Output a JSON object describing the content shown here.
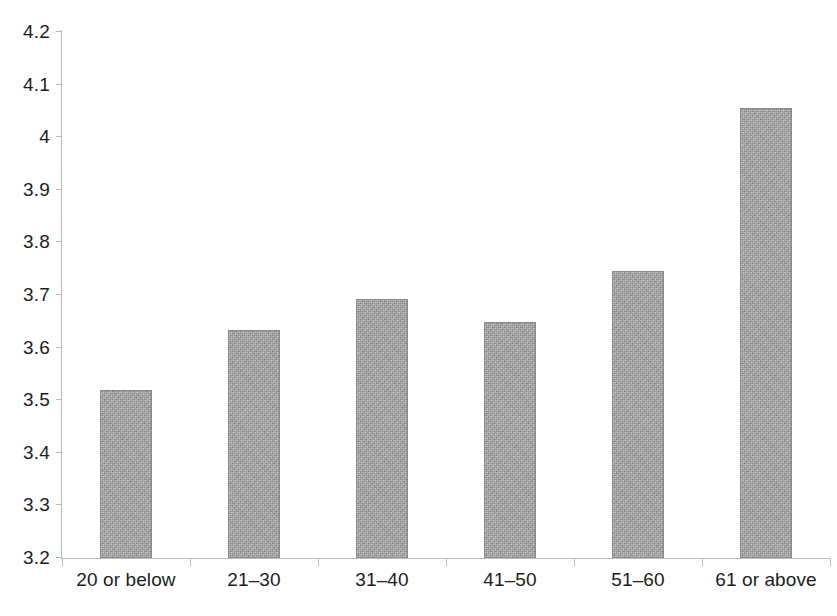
{
  "chart_data": {
    "type": "bar",
    "title": "",
    "subtitle": "",
    "xlabel": "",
    "ylabel": "",
    "categories": [
      "20 or below",
      "21–30",
      "31–40",
      "41–50",
      "51–60",
      "61 or above"
    ],
    "values": [
      3.52,
      3.633,
      3.692,
      3.649,
      3.745,
      4.056
    ],
    "series": [
      {
        "name": "",
        "values": [
          3.52,
          3.633,
          3.692,
          3.649,
          3.745,
          4.056
        ]
      }
    ],
    "ylim": [
      3.2,
      4.2
    ],
    "ytick_labels": [
      "3.2",
      "3.3",
      "3.4",
      "3.5",
      "3.6",
      "3.7",
      "3.8",
      "3.9",
      "4",
      "4.1",
      "4.2"
    ],
    "ytick_values": [
      3.2,
      3.3,
      3.4,
      3.5,
      3.6,
      3.7,
      3.8,
      3.9,
      4.0,
      4.1,
      4.2
    ],
    "grid": false,
    "legend": false,
    "legend_position": "none",
    "annotations": [],
    "bar_color": "#9d9d9d",
    "bar_border_color": "#8a8a8a",
    "axis_color": "#bdbdbd",
    "text_color": "#1d1d1d",
    "background_color": "#ffffff"
  }
}
